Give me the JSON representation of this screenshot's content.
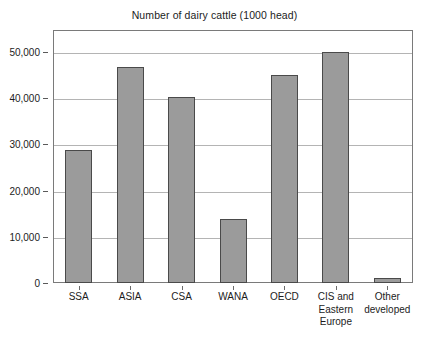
{
  "chart_data": {
    "type": "bar",
    "title": "Number of dairy cattle (1000 head)",
    "xlabel": "",
    "ylabel": "",
    "categories": [
      "SSA",
      "ASIA",
      "CSA",
      "WANA",
      "OECD",
      "CIS and Eastern Europe",
      "Other developed"
    ],
    "category_lines": [
      [
        "SSA"
      ],
      [
        "ASIA"
      ],
      [
        "CSA"
      ],
      [
        "WANA"
      ],
      [
        "OECD"
      ],
      [
        "CIS and",
        "Eastern",
        "Europe"
      ],
      [
        "Other",
        "developed"
      ]
    ],
    "values": [
      28800,
      46700,
      40200,
      13800,
      45000,
      50100,
      1000
    ],
    "ylim": [
      0,
      54800
    ],
    "yticks": [
      0,
      10000,
      20000,
      30000,
      40000,
      50000
    ],
    "ytick_labels": [
      "0",
      "10,000",
      "20,000",
      "30,000",
      "40,000",
      "50,000"
    ],
    "grid": true,
    "legend": false,
    "colors": {
      "bar_fill": "#9b9b9b",
      "bar_border": "#4a4a4a",
      "gridline": "#b4b4b4",
      "frame": "#7a7a7a",
      "text": "#1c1c1c",
      "background": "#ffffff"
    }
  }
}
